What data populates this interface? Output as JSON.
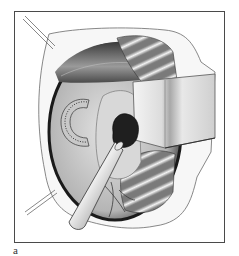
{
  "figure": {
    "panel_label": "a",
    "colors": {
      "frame": "#4a4a4a",
      "background": "#ffffff",
      "tissue_dark": "#1e1e1e",
      "tissue_mid": "#8a8a8a",
      "tissue_light": "#d6d6d6",
      "lesion": "#202020"
    },
    "elements": [
      "skin-flap-outline",
      "retraction-sutures",
      "upper-muscle-layer",
      "ribbed-muscle-upper",
      "ribbed-muscle-lower",
      "retractor-blade",
      "dotted-c-shaped-implant",
      "dark-lesion",
      "suction-instrument",
      "vessels-lower"
    ]
  }
}
